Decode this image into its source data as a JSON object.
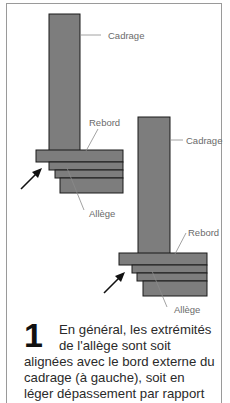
{
  "diagram": {
    "left": {
      "labels": {
        "cadrage": "Cadrage",
        "rebord": "Rebord",
        "allege": "Allège"
      }
    },
    "right": {
      "labels": {
        "cadrage": "Cadrage",
        "rebord": "Rebord",
        "allege": "Allège"
      }
    },
    "colors": {
      "fill": "#7d7d7d",
      "stroke": "#1a1a1a",
      "label": "#6a6a6a",
      "frame": "#9a9a9a"
    }
  },
  "caption": {
    "number": "1",
    "lines": [
      "En général, les extrémités",
      "de l'allège sont soit",
      "alignées avec le bord externe du",
      "cadrage (à gauche), soit en",
      "léger dépassement par rapport"
    ]
  }
}
